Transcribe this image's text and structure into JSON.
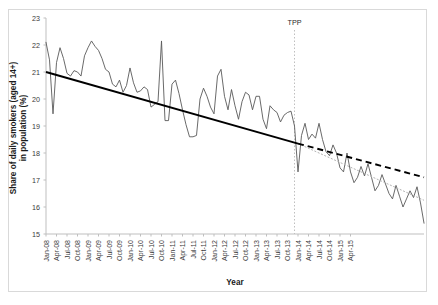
{
  "chart_data": {
    "type": "line",
    "title": "",
    "xlabel": "Year",
    "ylabel": "Share of daily smokers (aged 14+) in population (%)",
    "ylim": [
      15,
      23
    ],
    "yticks": [
      15,
      16,
      17,
      18,
      19,
      20,
      21,
      22,
      23
    ],
    "grid": false,
    "legend": "none",
    "x_tick_labels": [
      "Jan-08",
      "Apr-08",
      "Jul-08",
      "Oct-08",
      "Jan-09",
      "Apr-09",
      "Jul-09",
      "Oct-09",
      "Jan-10",
      "Apr-10",
      "Jul-10",
      "Oct-10",
      "Jan-11",
      "Apr-11",
      "Jul-11",
      "Oct-11",
      "Jan-12",
      "Apr-12",
      "Jul-12",
      "Oct-12",
      "Jan-13",
      "Apr-13",
      "Jul-13",
      "Oct-13",
      "Jan-14",
      "Apr-14",
      "Jul-14",
      "Oct-14",
      "Jan-15",
      "Apr-15"
    ],
    "x_tick_index": [
      0,
      3,
      6,
      9,
      12,
      15,
      18,
      21,
      24,
      27,
      30,
      33,
      36,
      39,
      42,
      45,
      48,
      51,
      54,
      57,
      60,
      63,
      66,
      69,
      72,
      75,
      78,
      81,
      84,
      87
    ],
    "series": [
      {
        "name": "Share of daily smokers (aged 14+) in population (%)",
        "style": "solid-thin",
        "color": "#595959",
        "values": [
          22.1,
          21.45,
          19.45,
          21.35,
          21.9,
          21.5,
          20.95,
          20.85,
          21.05,
          21.0,
          20.85,
          21.6,
          21.9,
          22.15,
          21.95,
          21.8,
          21.5,
          21.1,
          21.0,
          20.55,
          20.45,
          20.7,
          20.25,
          20.5,
          21.15,
          20.6,
          20.25,
          20.3,
          20.45,
          20.35,
          19.7,
          19.8,
          19.9,
          22.15,
          19.2,
          19.2,
          20.55,
          20.7,
          20.2,
          19.6,
          19.05,
          18.6,
          18.6,
          18.65,
          20.0,
          20.4,
          20.1,
          19.7,
          19.45,
          20.85,
          21.1,
          20.1,
          19.6,
          20.35,
          19.75,
          19.25,
          19.9,
          20.25,
          20.15,
          19.6,
          20.1,
          20.1,
          19.25,
          18.9,
          19.75,
          19.6,
          19.5,
          19.15,
          19.4,
          19.5,
          19.55,
          19.0,
          17.3,
          18.65,
          19.1,
          18.5,
          18.7,
          18.55,
          19.1,
          18.5,
          18.05,
          17.9,
          18.3,
          18.0,
          17.45,
          17.3,
          18.0,
          17.3,
          16.9,
          17.1,
          17.5,
          17.15,
          17.6,
          17.1,
          16.6,
          16.8,
          17.2,
          16.85,
          16.5,
          16.3,
          16.8,
          16.4,
          16.0,
          16.3,
          16.6,
          16.35,
          16.75,
          16.15,
          15.4
        ]
      }
    ],
    "trend_pre_tpp": {
      "name": "Pre-TPP linear trend",
      "style": "solid-thick",
      "color": "#000000",
      "x_start_index": 0,
      "x_end_index": 72,
      "y_start": 21.0,
      "y_end": 18.35
    },
    "trend_projection": {
      "name": "Counterfactual projection (dashed)",
      "style": "dashed",
      "color": "#000000",
      "x_start_index": 72,
      "x_end_index": 108,
      "y_start": 18.35,
      "y_end": 17.1
    },
    "trend_post_tpp": {
      "name": "Post-TPP fitted trend",
      "style": "dotted-faint",
      "color": "#b3b3b3",
      "x_start_index": 72,
      "x_end_index": 108,
      "y_start": 18.35,
      "y_end": 16.25
    },
    "annotations": [
      {
        "name": "tpp-marker",
        "label": "TPP",
        "x_index": 71,
        "line_style": "dotted",
        "line_color": "#bfbfbf"
      }
    ]
  }
}
